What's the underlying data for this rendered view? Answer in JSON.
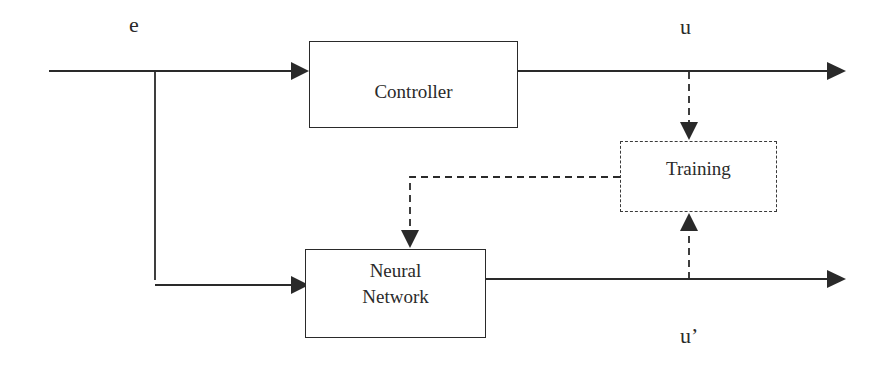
{
  "diagram": {
    "type": "block-diagram",
    "signals": {
      "input": "e",
      "controller_output": "u",
      "network_output": "u’"
    },
    "blocks": {
      "controller": {
        "label": "Controller"
      },
      "neural_network": {
        "label_line1": "Neural",
        "label_line2": "Network"
      },
      "training": {
        "label": "Training"
      }
    },
    "connections": [
      {
        "from": "input e",
        "to": "Controller",
        "style": "solid"
      },
      {
        "from": "input e",
        "to": "Neural Network",
        "style": "solid"
      },
      {
        "from": "Controller",
        "to": "output u",
        "style": "solid"
      },
      {
        "from": "Neural Network",
        "to": "output u’",
        "style": "solid"
      },
      {
        "from": "u",
        "to": "Training",
        "style": "dashed"
      },
      {
        "from": "u’",
        "to": "Training",
        "style": "dashed"
      },
      {
        "from": "Training",
        "to": "Neural Network",
        "style": "dashed"
      }
    ],
    "colors": {
      "line": "#2a2a2a",
      "background": "#ffffff"
    }
  }
}
